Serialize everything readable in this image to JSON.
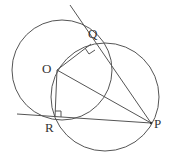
{
  "diagram": {
    "type": "geometry",
    "colors": {
      "stroke": "#555555",
      "label": "#333333",
      "background": "#ffffff"
    },
    "points": {
      "O": {
        "label": "O",
        "x": 57,
        "y": 70
      },
      "Q": {
        "label": "Q",
        "x": 91,
        "y": 44
      },
      "R": {
        "label": "R",
        "x": 55,
        "y": 117
      },
      "P": {
        "label": "P",
        "x": 151,
        "y": 123
      }
    },
    "circles": [
      {
        "name": "circle-centered-O",
        "cx": 62,
        "cy": 70,
        "r": 50
      },
      {
        "name": "circle-through-OQPR",
        "cx": 105,
        "cy": 97,
        "r": 54
      }
    ],
    "segments": [
      {
        "name": "tangent-line-QP",
        "from": [
          70,
          5
        ],
        "to": [
          151,
          123
        ]
      },
      {
        "name": "tangent-line-RP",
        "from": [
          17,
          114
        ],
        "to": [
          151,
          123
        ]
      },
      {
        "name": "segment-OQ",
        "from": [
          57,
          70
        ],
        "to": [
          91,
          44
        ]
      },
      {
        "name": "segment-OR",
        "from": [
          57,
          70
        ],
        "to": [
          55,
          117
        ]
      },
      {
        "name": "segment-OP",
        "from": [
          57,
          70
        ],
        "to": [
          151,
          123
        ]
      }
    ],
    "right_angles": [
      "Q",
      "R"
    ]
  }
}
